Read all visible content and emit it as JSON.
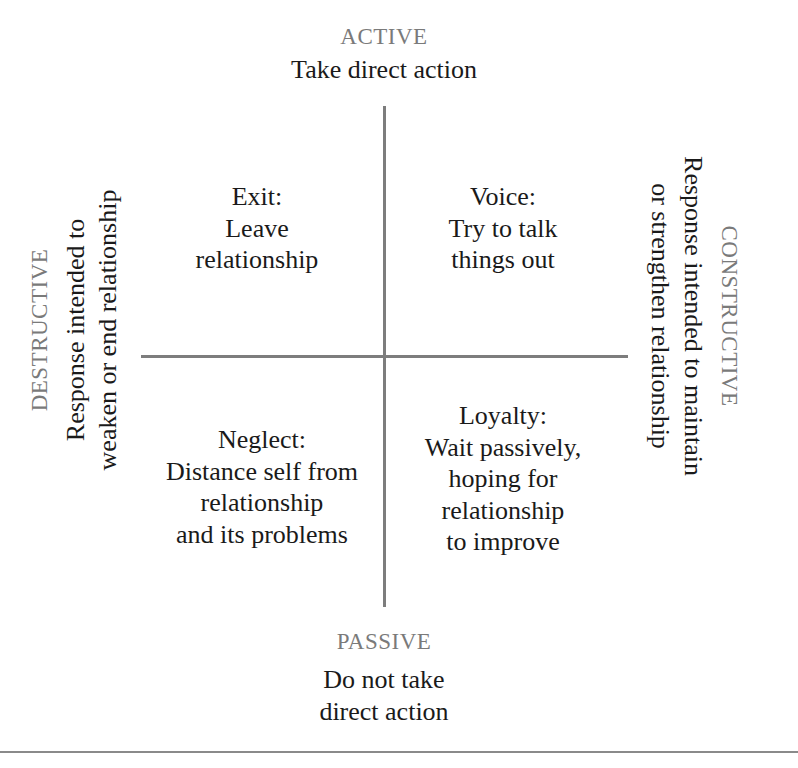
{
  "top": {
    "axis_label": "ACTIVE",
    "description": "Take direct action"
  },
  "bottom": {
    "axis_label": "PASSIVE",
    "description_lines": [
      "Do not take",
      "direct action"
    ]
  },
  "left": {
    "axis_label": "DESTRUCTIVE",
    "description_lines": [
      "Response intended to",
      "weaken or end relationship"
    ]
  },
  "right": {
    "axis_label": "CONSTRUCTIVE",
    "description_lines": [
      "Response intended to maintain",
      "or strengthen relationship"
    ]
  },
  "quadrants": {
    "top_left": {
      "title": "Exit:",
      "lines": [
        "Leave",
        "relationship"
      ]
    },
    "top_right": {
      "title": "Voice:",
      "lines": [
        "Try to talk",
        "things out"
      ]
    },
    "bottom_left": {
      "title": "Neglect:",
      "lines": [
        "Distance self from",
        "relationship",
        "and its problems"
      ]
    },
    "bottom_right": {
      "title": "Loyalty:",
      "lines": [
        "Wait passively,",
        "hoping for",
        "relationship",
        "to improve"
      ]
    }
  },
  "colors": {
    "axis_label": "#7a7a7a",
    "text": "#1a1a1a",
    "lines": "#7d7d7d",
    "background": "#ffffff"
  }
}
